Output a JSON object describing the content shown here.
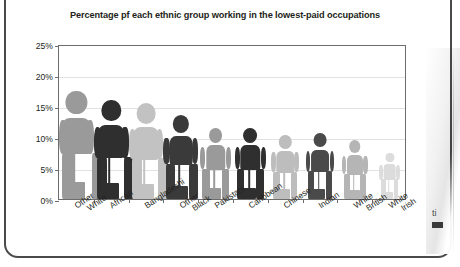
{
  "chart_data": {
    "type": "bar",
    "title": "Percentage pf each ethnic group working in the lowest-paid occupations",
    "title_line1": "Percentage pf each ethnic group working in the",
    "title_line2": "lowest-paid occupations",
    "xlabel": "",
    "ylabel": "",
    "ylim": [
      0,
      25
    ],
    "grid": true,
    "legend": "none",
    "ytick_labels": [
      "25%",
      "20%",
      "15%",
      "10%",
      "5%",
      "0%"
    ],
    "ytick_values": [
      25,
      20,
      15,
      10,
      5,
      0
    ],
    "categories": [
      "Other White",
      "African",
      "Bangladeshi",
      "Other Black",
      "Pakistani",
      "Caribbean",
      "Chinese",
      "Indian",
      "White British",
      "White Irish"
    ],
    "category_lines": [
      [
        "Other",
        "White"
      ],
      [
        "African",
        ""
      ],
      [
        "Bangladeshi",
        ""
      ],
      [
        "Other",
        "Black"
      ],
      [
        "Pakistani",
        ""
      ],
      [
        "Caribbean",
        ""
      ],
      [
        "Chinese",
        ""
      ],
      [
        "Indian",
        ""
      ],
      [
        "White",
        "British"
      ],
      [
        "White",
        "Irish"
      ]
    ],
    "values": [
      17.5,
      16.0,
      15.5,
      13.5,
      11.5,
      11.5,
      10.3,
      10.6,
      9.5,
      7.5
    ],
    "marker_style": "pictogram-person-with-broom",
    "series": [
      {
        "name": "Percentage in lowest-paid occupations",
        "values": [
          17.5,
          16.0,
          15.5,
          13.5,
          11.5,
          11.5,
          10.3,
          10.6,
          9.5,
          7.5
        ]
      }
    ],
    "point_colors": [
      "#9a9a9a",
      "#2f2f2f",
      "#c2c2c2",
      "#3a3a3a",
      "#9a9a9a",
      "#2f2f2f",
      "#bdbdbd",
      "#4a4a4a",
      "#b5b5b5",
      "#dcdcdc"
    ],
    "colors": {
      "dark_figure": "#2f2f2f",
      "light_figure": "#b5b5b5",
      "axis": "#6d6d6d",
      "gridline": "#e2e2e2",
      "text": "#231f20",
      "background": "#ffffff"
    }
  },
  "frame": {
    "edge_fragment_text": "ti"
  }
}
